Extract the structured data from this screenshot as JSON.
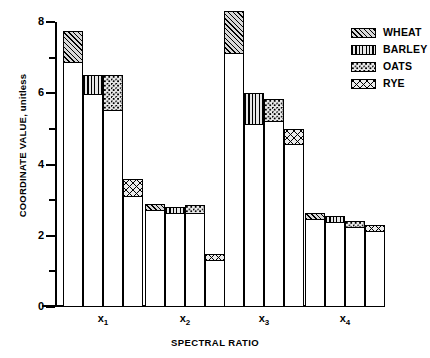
{
  "chart_data": {
    "type": "bar",
    "title": "",
    "xlabel": "SPECTRAL RATIO",
    "ylabel": "COORDINATE VALUE, unitless",
    "ylim": [
      0,
      8
    ],
    "y_major_ticks": [
      0,
      2,
      4,
      6,
      8
    ],
    "y_minor_ticks": [
      1,
      3,
      5,
      7
    ],
    "grid": false,
    "legend_position": "top-right",
    "categories": [
      "x₁",
      "x₂",
      "x₃",
      "x₄"
    ],
    "category_labels_plain": [
      "x1",
      "x2",
      "x3",
      "x4"
    ],
    "series": [
      {
        "name": "WHEAT",
        "pattern": "diagonal-hatch",
        "values": [
          7.75,
          2.9,
          8.3,
          2.65
        ]
      },
      {
        "name": "BARLEY",
        "pattern": "vertical-lines",
        "values": [
          6.5,
          2.8,
          6.0,
          2.55
        ]
      },
      {
        "name": "OATS",
        "pattern": "stipple-dots",
        "values": [
          6.5,
          2.85,
          5.85,
          2.42
        ]
      },
      {
        "name": "RYE",
        "pattern": "cross-hatch",
        "values": [
          3.6,
          1.5,
          5.0,
          2.3
        ]
      }
    ],
    "series_baselines": [
      {
        "name": "WHEAT",
        "values": [
          6.85,
          2.7,
          7.1,
          2.48
        ]
      },
      {
        "name": "BARLEY",
        "values": [
          5.95,
          2.62,
          5.1,
          2.4
        ]
      },
      {
        "name": "OATS",
        "values": [
          5.5,
          2.62,
          5.2,
          2.28
        ]
      },
      {
        "name": "RYE",
        "values": [
          3.1,
          1.38,
          4.55,
          2.18
        ]
      }
    ]
  },
  "axes": {
    "y_title": "COORDINATE VALUE, unitless",
    "x_title": "SPECTRAL RATIO",
    "y_labels": [
      "8",
      "6",
      "4",
      "2",
      "0"
    ],
    "x_labels": [
      {
        "base": "x",
        "sub": "1"
      },
      {
        "base": "x",
        "sub": "2"
      },
      {
        "base": "x",
        "sub": "3"
      },
      {
        "base": "x",
        "sub": "4"
      }
    ]
  },
  "legend": {
    "items": [
      {
        "label": "WHEAT",
        "pattern": "diagonal-hatch"
      },
      {
        "label": "BARLEY",
        "pattern": "vertical-lines"
      },
      {
        "label": "OATS",
        "pattern": "stipple-dots"
      },
      {
        "label": "RYE",
        "pattern": "cross-hatch"
      }
    ]
  },
  "colors": {
    "ink": "#000000",
    "background": "#ffffff",
    "fill_wheat": "#d8d8d8",
    "fill_barley": "#e8e8e8",
    "fill_oats": "#e9e9e9",
    "fill_rye": "#ececec"
  }
}
